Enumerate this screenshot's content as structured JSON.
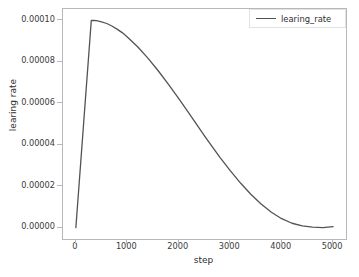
{
  "chart_data": {
    "type": "line",
    "title": "",
    "xlabel": "step",
    "ylabel": "learing rate",
    "xlim": [
      -250,
      5250
    ],
    "ylim": [
      -5.5e-06,
      0.0001055
    ],
    "grid": false,
    "legend_position": "upper right",
    "series": [
      {
        "name": "learing_rate",
        "color": "#535353",
        "linewidth": 1.3,
        "x": [
          0,
          50,
          100,
          150,
          200,
          250,
          300,
          350,
          400,
          500,
          600,
          700,
          800,
          900,
          1000,
          1200,
          1400,
          1600,
          1800,
          2000,
          2200,
          2400,
          2500,
          2600,
          2800,
          3000,
          3200,
          3400,
          3600,
          3800,
          4000,
          4200,
          4400,
          4600,
          4800,
          5000
        ],
        "y": [
          0.0,
          1.67e-05,
          3.33e-05,
          5e-05,
          6.67e-05,
          8.33e-05,
          0.0001,
          9.996e-05,
          9.985e-05,
          9.93e-05,
          9.85e-05,
          9.73e-05,
          9.58e-05,
          9.41e-05,
          9.2e-05,
          8.73e-05,
          8.18e-05,
          7.57e-05,
          6.91e-05,
          6.22e-05,
          5.51e-05,
          4.79e-05,
          4.43e-05,
          4.08e-05,
          3.39e-05,
          2.75e-05,
          2.15e-05,
          1.61e-05,
          1.14e-05,
          7.4e-06,
          4.3e-06,
          2.1e-06,
          8e-07,
          2e-07,
          2e-08,
          5e-07
        ]
      }
    ],
    "xticks": [
      0,
      1000,
      2000,
      3000,
      4000,
      5000
    ],
    "xticklabels": [
      "0",
      "1000",
      "2000",
      "3000",
      "4000",
      "5000"
    ],
    "yticks": [
      0.0,
      2e-05,
      4e-05,
      6e-05,
      8e-05,
      0.0001
    ],
    "yticklabels": [
      "0.00000",
      "0.00002",
      "0.00004",
      "0.00006",
      "0.00008",
      "0.00010"
    ],
    "annotations": {
      "peak_value": 0.0001,
      "warmup_steps": 300,
      "total_steps": 5000,
      "schedule": "linear warmup then cosine decay"
    }
  },
  "legend": {
    "entries": [
      {
        "label": "learing_rate",
        "color": "#535353"
      }
    ]
  },
  "axis": {
    "xlabel": "step",
    "ylabel": "learing rate"
  },
  "colors": {
    "line": "#535353",
    "frame": "#b8b8b8",
    "text": "#2e2e2e",
    "background": "#ffffff"
  }
}
